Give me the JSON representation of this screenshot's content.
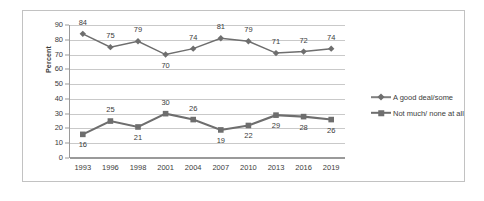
{
  "chart_data": {
    "type": "line",
    "title": "",
    "xlabel": "",
    "ylabel": "Percent",
    "categories": [
      "1993",
      "1996",
      "1998",
      "2001",
      "2004",
      "2007",
      "2010",
      "2013",
      "2016",
      "2019"
    ],
    "ylim": [
      0,
      90
    ],
    "ytick_step": 10,
    "yticks": [
      "90",
      "80",
      "70",
      "60",
      "50",
      "40",
      "30",
      "20",
      "10",
      "0"
    ],
    "grid": "horizontal",
    "legend_position": "right",
    "series": [
      {
        "name": "A good deal/some",
        "marker": "diamond",
        "color": "#6e6e6e",
        "values": [
          84,
          75,
          79,
          70,
          74,
          81,
          79,
          71,
          72,
          74
        ],
        "labels": [
          "84",
          "75",
          "79",
          "70",
          "74",
          "81",
          "79",
          "71",
          "72",
          "74"
        ],
        "label_positions": [
          "above",
          "above",
          "above",
          "below",
          "above",
          "above",
          "above",
          "above",
          "above",
          "above"
        ]
      },
      {
        "name": "Not much/ none at all",
        "marker": "square",
        "color": "#6e6e6e",
        "values": [
          16,
          25,
          21,
          30,
          26,
          19,
          22,
          29,
          28,
          26
        ],
        "labels": [
          "16",
          "25",
          "21",
          "30",
          "26",
          "19",
          "22",
          "29",
          "28",
          "26"
        ],
        "label_positions": [
          "below",
          "above",
          "below",
          "above",
          "above",
          "below",
          "below",
          "below",
          "below",
          "below"
        ]
      }
    ]
  },
  "legend": {
    "items": [
      {
        "label": "A good deal/some"
      },
      {
        "label": "Not much/ none at all"
      }
    ]
  }
}
